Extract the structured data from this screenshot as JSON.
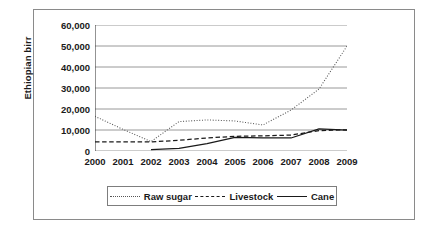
{
  "chart_data": {
    "type": "line",
    "title": "",
    "xlabel": "",
    "ylabel": "Ethiopian birr",
    "categories": [
      "2000",
      "2001",
      "2002",
      "2003",
      "2004",
      "2005",
      "2006",
      "2007",
      "2008",
      "2009"
    ],
    "ylim": [
      0,
      60000
    ],
    "ytick_labels": [
      "0",
      "10,000",
      "20,000",
      "30,000",
      "40,000",
      "50,000",
      "60,000"
    ],
    "ytick_values": [
      0,
      10000,
      20000,
      30000,
      40000,
      50000,
      60000
    ],
    "grid": "horizontal",
    "legend_position": "bottom",
    "series": [
      {
        "name": "Raw sugar",
        "style": "dotted",
        "color": "#555555",
        "values": [
          16500,
          10300,
          4500,
          14000,
          14800,
          14300,
          12400,
          19500,
          29500,
          50000
        ]
      },
      {
        "name": "Livestock",
        "style": "dashed",
        "color": "#1a1a1a",
        "values": [
          4300,
          4300,
          4300,
          5100,
          6200,
          7000,
          7200,
          7600,
          9700,
          10100
        ]
      },
      {
        "name": "Cane",
        "style": "solid",
        "color": "#1a1a1a",
        "values": [
          null,
          null,
          700,
          1200,
          3500,
          6500,
          6300,
          6200,
          10500,
          9900
        ]
      }
    ]
  }
}
